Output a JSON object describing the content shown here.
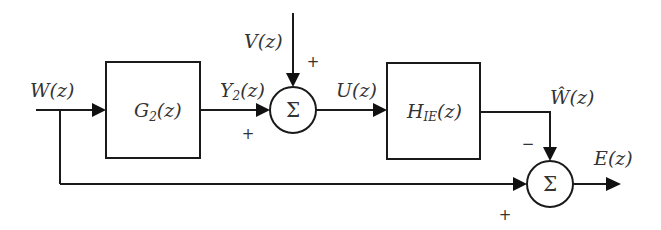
{
  "diagram": {
    "type": "block-diagram",
    "blocks": [
      {
        "id": "G2",
        "label_main": "G",
        "label_sub": "2",
        "label_tail": "(z)"
      },
      {
        "id": "HIE",
        "label_main": "H",
        "label_sub": "IE",
        "label_tail": "(z)"
      }
    ],
    "junctions": [
      {
        "id": "sum1",
        "symbol": "Σ",
        "inputs": [
          {
            "from": "Y2",
            "sign": "+"
          },
          {
            "from": "V",
            "sign": "+"
          }
        ],
        "output": "U"
      },
      {
        "id": "sum2",
        "symbol": "Σ",
        "inputs": [
          {
            "from": "What",
            "sign": "−"
          },
          {
            "from": "W",
            "sign": "+"
          }
        ],
        "output": "E"
      }
    ],
    "signals": {
      "W": {
        "main": "W",
        "tail": "(z)"
      },
      "V": {
        "main": "V",
        "tail": "(z)"
      },
      "Y2": {
        "main": "Y",
        "sub": "2",
        "tail": "(z)"
      },
      "U": {
        "main": "U",
        "tail": "(z)"
      },
      "What": {
        "main": "Ŵ",
        "tail": "(z)"
      },
      "E": {
        "main": "E",
        "tail": "(z)"
      }
    },
    "signs": {
      "sum1_v": "+",
      "sum1_y2": "+",
      "sum2_what": "−",
      "sum2_w": "+"
    }
  }
}
